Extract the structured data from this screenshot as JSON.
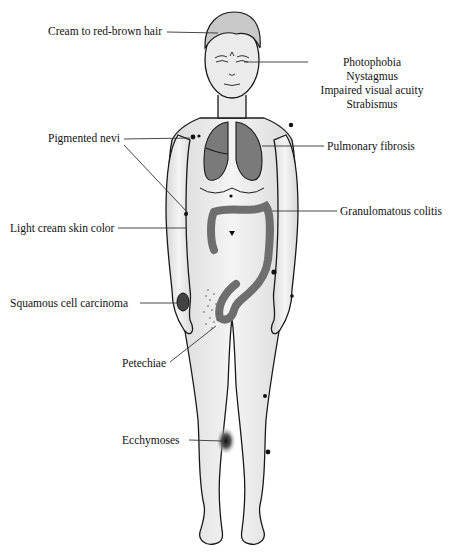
{
  "figure": {
    "colors": {
      "skin": "#ebebeb",
      "outline": "#1a1a1a",
      "organ": "#7a7a7a",
      "organ_dark": "#555555",
      "leader_line": "#333333",
      "background": "#ffffff"
    }
  },
  "labels": {
    "hair": "Cream to red-brown hair",
    "eyes": [
      "Photophobia",
      "Nystagmus",
      "Impaired visual acuity",
      "Strabismus"
    ],
    "nevi": "Pigmented nevi",
    "lungs": "Pulmonary fibrosis",
    "colon": "Granulomatous colitis",
    "skin": "Light cream skin color",
    "scc": "Squamous cell carcinoma",
    "petechiae": "Petechiae",
    "ecchymoses": "Ecchymoses"
  }
}
